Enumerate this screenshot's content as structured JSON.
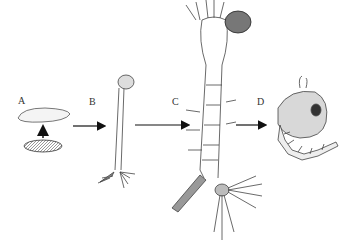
{
  "figure": {
    "labels": {
      "a": "A",
      "b": "B",
      "c": "C",
      "d": "D"
    },
    "stages": [
      {
        "label": "A",
        "name": "egg"
      },
      {
        "label": "B",
        "name": "early-larva"
      },
      {
        "label": "C",
        "name": "late-larva"
      },
      {
        "label": "D",
        "name": "pupa"
      }
    ]
  }
}
